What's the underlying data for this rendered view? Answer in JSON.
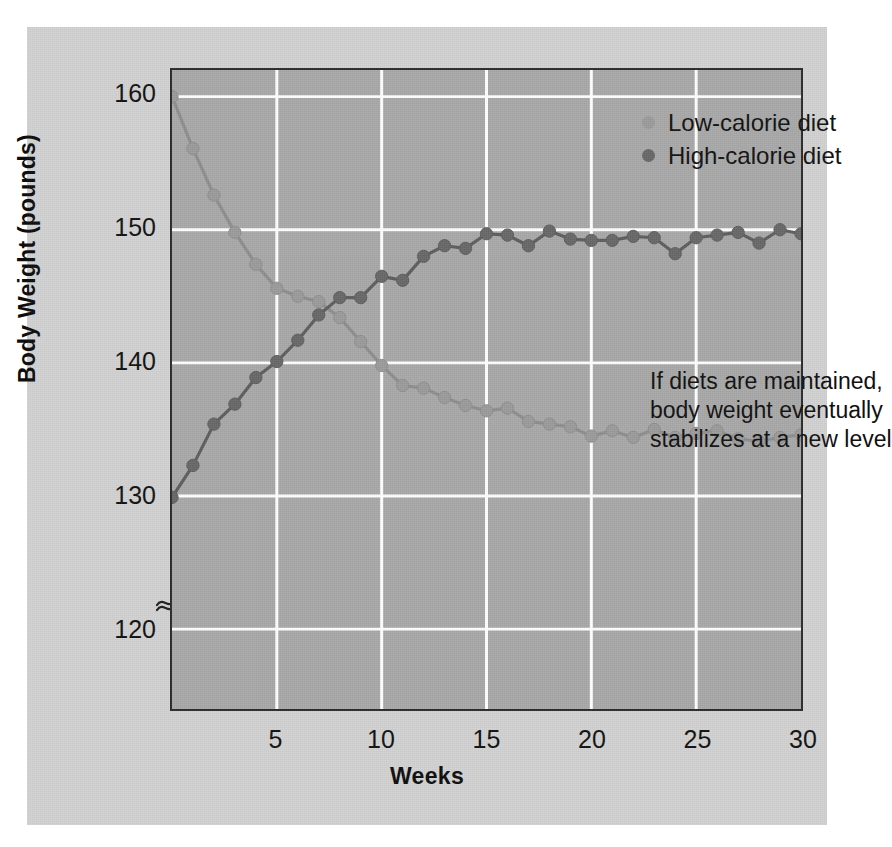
{
  "chart_data": {
    "type": "line",
    "title": "",
    "xlabel": "Weeks",
    "ylabel": "Body Weight (pounds)",
    "xlim": [
      0,
      30
    ],
    "ylim": [
      114,
      162
    ],
    "ytick_values": [
      120,
      130,
      140,
      150,
      160
    ],
    "ytick_labels": [
      "120",
      "130",
      "140",
      "150",
      "160"
    ],
    "xtick_values": [
      5,
      10,
      15,
      20,
      25,
      30
    ],
    "xtick_labels": [
      "5",
      "10",
      "15",
      "20",
      "25",
      "30"
    ],
    "grid": true,
    "grid_color": "#ffffff",
    "plot_background": "#a9a9a9",
    "figure_background": "#d2d2d2",
    "axis_break": true,
    "axis_break_note": "y-axis broken below 120",
    "legend_position": "top-right inside plot",
    "x": [
      0,
      1,
      2,
      3,
      4,
      5,
      6,
      7,
      8,
      9,
      10,
      11,
      12,
      13,
      14,
      15,
      16,
      17,
      18,
      19,
      20,
      21,
      22,
      23,
      24,
      25,
      26,
      27,
      28,
      29,
      30
    ],
    "series": [
      {
        "name": "Low-calorie diet",
        "color": "#9b9b9b",
        "line_color": "#8e8e8e",
        "values": [
          160.0,
          156.1,
          152.6,
          149.8,
          147.4,
          145.6,
          145.0,
          144.6,
          143.4,
          141.6,
          139.8,
          138.3,
          138.1,
          137.4,
          136.8,
          136.4,
          136.6,
          135.6,
          135.4,
          135.2,
          134.5,
          134.9,
          134.4,
          135.0,
          134.4,
          134.7,
          134.9,
          134.3,
          134.1,
          134.4,
          134.6
        ]
      },
      {
        "name": "High-calorie diet",
        "color": "#686868",
        "line_color": "#5e5e5e",
        "values": [
          129.9,
          132.3,
          135.4,
          136.9,
          138.9,
          140.1,
          141.7,
          143.6,
          144.9,
          144.9,
          146.5,
          146.2,
          148.0,
          148.8,
          148.6,
          149.7,
          149.6,
          148.8,
          149.9,
          149.3,
          149.2,
          149.2,
          149.5,
          149.4,
          148.2,
          149.4,
          149.6,
          149.8,
          149.0,
          150.0,
          149.7
        ]
      }
    ],
    "annotation": {
      "lines": [
        "If diets are maintained,",
        "body weight eventually",
        "stabilizes at a new level"
      ]
    }
  },
  "axis": {
    "y_title": "Body Weight (pounds)",
    "x_title": "Weeks"
  },
  "legend": {
    "items": [
      {
        "label": "Low-calorie diet",
        "color": "#9b9b9b"
      },
      {
        "label": "High-calorie diet",
        "color": "#686868"
      }
    ]
  },
  "annotation_text": {
    "line1": "If diets are maintained,",
    "line2": "body weight eventually",
    "line3": "stabilizes at a new level"
  }
}
